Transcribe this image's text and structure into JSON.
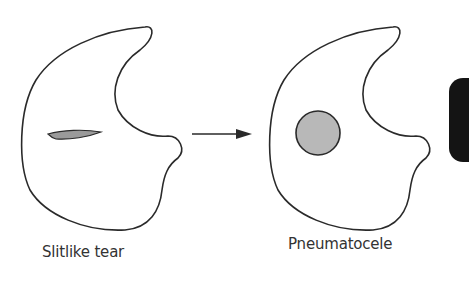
{
  "diagram": {
    "panels": [
      {
        "label": "Slitlike tear",
        "feature": "slit-shaped lesion",
        "feature_color": "#9a9a9a"
      },
      {
        "label": "Pneumatocele",
        "feature": "round cavity",
        "feature_color": "#b8b8b8"
      }
    ],
    "connector": {
      "type": "arrow",
      "direction": "right"
    },
    "colors": {
      "outline": "#2a2a2a",
      "background": "#ffffff",
      "edge_tab": "#141414"
    }
  }
}
